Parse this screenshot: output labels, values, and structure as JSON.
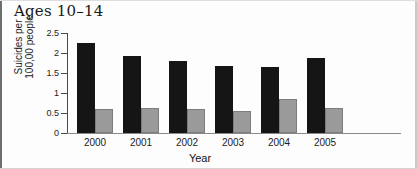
{
  "chart_data": {
    "type": "bar",
    "title": "Ages 10–14",
    "xlabel": "Year",
    "ylabel": "Suicides per 100,00 people",
    "ylabel_line1": "Suicides per",
    "ylabel_line2": "100,00 people",
    "categories": [
      "2000",
      "2001",
      "2002",
      "2003",
      "2004",
      "2005"
    ],
    "ylim": [
      0,
      2.5
    ],
    "yticks": [
      "0",
      "0.5",
      "1",
      "1.5",
      "2",
      "2.5"
    ],
    "ytick_values": [
      0,
      0.5,
      1,
      1.5,
      2,
      2.5
    ],
    "grid": false,
    "legend": "none",
    "series": [
      {
        "name": "series-dark",
        "color": "#151515",
        "values": [
          2.25,
          1.92,
          1.8,
          1.68,
          1.65,
          1.88
        ]
      },
      {
        "name": "series-light",
        "color": "#9a9a9a",
        "values": [
          0.6,
          0.62,
          0.61,
          0.54,
          0.86,
          0.63
        ]
      }
    ]
  }
}
